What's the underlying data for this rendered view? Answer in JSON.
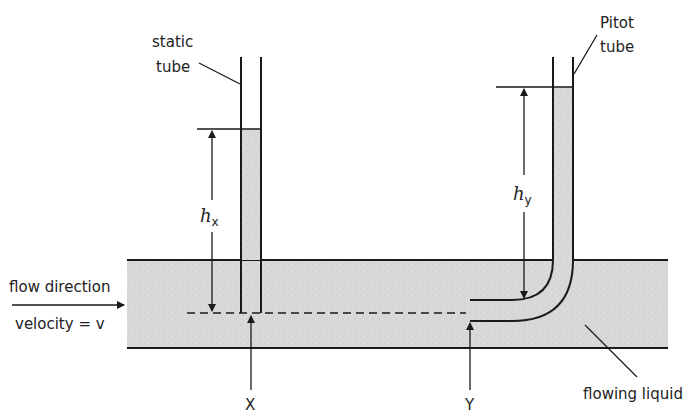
{
  "labels": {
    "static_tube_line1": "static",
    "static_tube_line2": "tube",
    "pitot_tube_line1": "Pitot",
    "pitot_tube_line2": "tube",
    "flow_direction": "flow direction",
    "velocity": "velocity = v",
    "hx_main": "h",
    "hx_sub": "x",
    "hy_main": "h",
    "hy_sub": "y",
    "point_x": "X",
    "point_y": "Y",
    "flowing_liquid": "flowing liquid"
  },
  "colors": {
    "liquid_fill": "#d9d9d9",
    "line": "#1a1a1a",
    "background": "#ffffff"
  }
}
